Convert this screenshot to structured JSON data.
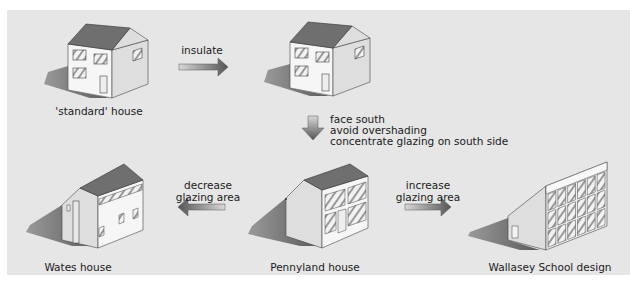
{
  "nodes": {
    "standard": {
      "label": "'standard' house"
    },
    "insulated": {
      "label": ""
    },
    "pennyland": {
      "label": "Pennyland house"
    },
    "wates": {
      "label": "Wates house"
    },
    "wallasey": {
      "label": "Wallasey School design"
    }
  },
  "arrows": {
    "insulate": {
      "label": "insulate",
      "direction": "right"
    },
    "south": {
      "lines": [
        "face south",
        "avoid overshading",
        "concentrate glazing on south side"
      ],
      "direction": "down"
    },
    "decrease": {
      "lines": [
        "decrease",
        "glazing area"
      ],
      "direction": "left"
    },
    "increase": {
      "lines": [
        "increase",
        "glazing area"
      ],
      "direction": "right"
    }
  },
  "colors": {
    "background": "#e6e6e6",
    "roof": "#6f6f6f",
    "wall_front": "#f4f4f4",
    "wall_side": "#dcdcdc",
    "shadow": "#7a7a7a"
  }
}
